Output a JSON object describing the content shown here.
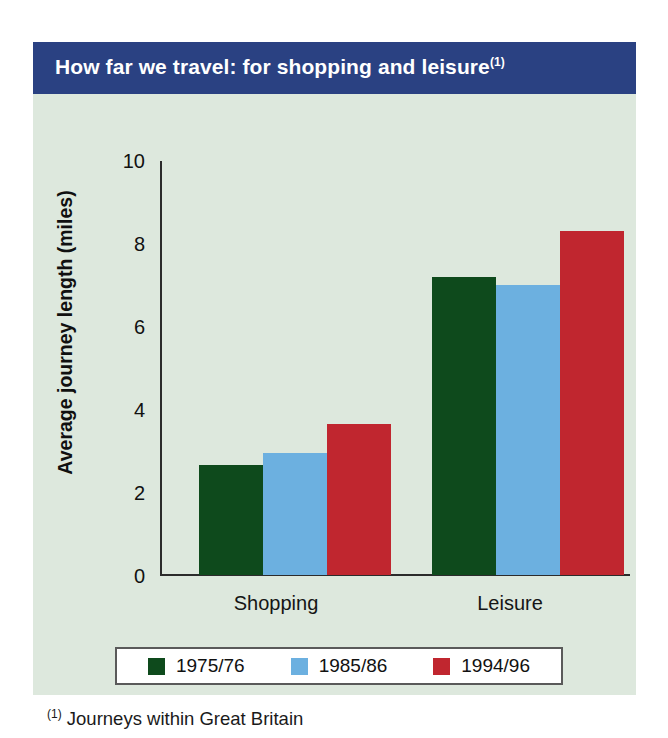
{
  "title": {
    "text": "How far we travel: for shopping and leisure",
    "footnote_marker": "(1)"
  },
  "footnote": {
    "marker": "(1)",
    "text": "Journeys within Great Britain"
  },
  "colors": {
    "panel_background": "#dde8dd",
    "title_bar": "#2a4182",
    "title_text": "#ffffff",
    "series_1975_76": "#0e4a1c",
    "series_1985_86": "#6cb0e0",
    "series_1994_96": "#c0262f",
    "axis": "#2b2b2b",
    "legend_background": "#ffffff",
    "legend_border": "#5a5a5a"
  },
  "legend": {
    "items": [
      {
        "label": "1975/76",
        "color": "#0e4a1c"
      },
      {
        "label": "1985/86",
        "color": "#6cb0e0"
      },
      {
        "label": "1994/96",
        "color": "#c0262f"
      }
    ]
  },
  "axis": {
    "y_title": "Average journey length (miles)",
    "y_ticks": [
      "10",
      "8",
      "6",
      "4",
      "2",
      "0"
    ],
    "x_categories": [
      "Shopping",
      "Leisure"
    ]
  },
  "chart_data": {
    "type": "bar",
    "title": "How far we travel: for shopping and leisure",
    "subtitle": "",
    "xlabel": "",
    "ylabel": "Average journey length (miles)",
    "categories": [
      "Shopping",
      "Leisure"
    ],
    "series": [
      {
        "name": "1975/76",
        "color": "#0e4a1c",
        "values": [
          2.65,
          7.2
        ]
      },
      {
        "name": "1985/86",
        "color": "#6cb0e0",
        "values": [
          2.95,
          7.0
        ]
      },
      {
        "name": "1994/96",
        "color": "#c0262f",
        "values": [
          3.65,
          8.3
        ]
      }
    ],
    "ylim": [
      0,
      10
    ],
    "ytick_values": [
      0,
      2,
      4,
      6,
      8,
      10
    ],
    "grid": false,
    "legend_position": "bottom",
    "annotations": [
      "(1) Journeys within Great Britain"
    ]
  }
}
